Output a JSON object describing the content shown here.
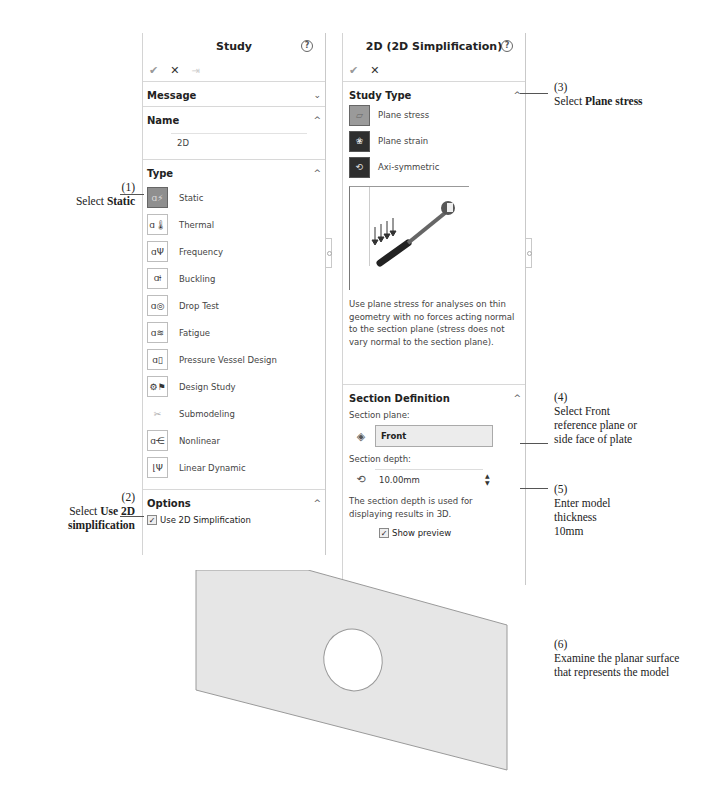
{
  "study_panel": {
    "title": "Study",
    "toolbar": {
      "ok": "✔",
      "cancel": "✕",
      "pin": "⇥"
    },
    "message": {
      "label": "Message",
      "chevron": "⌄"
    },
    "name": {
      "label": "Name",
      "value": "2D",
      "chevron": "^"
    },
    "type": {
      "label": "Type",
      "chevron": "^",
      "items": [
        {
          "label": "Static",
          "icon": "static-icon",
          "glyph": "ɑ⚡",
          "selected": true
        },
        {
          "label": "Thermal",
          "icon": "thermal-icon",
          "glyph": "ɑ🌡"
        },
        {
          "label": "Frequency",
          "icon": "frequency-icon",
          "glyph": "ɑΨ"
        },
        {
          "label": "Buckling",
          "icon": "buckling-icon",
          "glyph": "ɑ⟊"
        },
        {
          "label": "Drop Test",
          "icon": "drop-test-icon",
          "glyph": "ɑ◎"
        },
        {
          "label": "Fatigue",
          "icon": "fatigue-icon",
          "glyph": "ɑ≋"
        },
        {
          "label": "Pressure Vessel Design",
          "icon": "pressure-vessel-icon",
          "glyph": "ɑ▯"
        },
        {
          "label": "Design Study",
          "icon": "design-study-icon",
          "glyph": "⚙⚑"
        },
        {
          "label": "Submodeling",
          "icon": "submodeling-icon",
          "glyph": "✂"
        },
        {
          "label": "Nonlinear",
          "icon": "nonlinear-icon",
          "glyph": "ɑ⋲"
        },
        {
          "label": "Linear Dynamic",
          "icon": "linear-dynamic-icon",
          "glyph": "⌊Ψ"
        }
      ]
    },
    "options": {
      "label": "Options",
      "chevron": "^",
      "use_2d": {
        "label": "Use 2D Simplification",
        "checked": true,
        "mark": "✓"
      }
    }
  },
  "simplification_panel": {
    "title": "2D (2D Simplification)",
    "toolbar": {
      "ok": "✔",
      "cancel": "✕"
    },
    "study_type": {
      "label": "Study Type",
      "chevron": "^",
      "items": [
        {
          "label": "Plane stress",
          "icon": "plane-stress-icon",
          "glyph": "▱",
          "selected": true
        },
        {
          "label": "Plane strain",
          "icon": "plane-strain-icon",
          "glyph": "❀"
        },
        {
          "label": "Axi-symmetric",
          "icon": "axi-symmetric-icon",
          "glyph": "⟲"
        }
      ],
      "description": "Use plane stress for analyses on thin geometry with no forces acting normal to the section plane (stress does not vary normal to the section plane)."
    },
    "section_definition": {
      "label": "Section Definition",
      "chevron": "^",
      "plane_label": "Section plane:",
      "plane_value": "Front",
      "depth_label": "Section depth:",
      "depth_value": "10.00mm",
      "spinner_up": "▲",
      "spinner_down": "▼",
      "depth_note": "The section depth is used for displaying results in 3D.",
      "show_preview": {
        "label": "Show preview",
        "checked": true,
        "mark": "✓"
      }
    }
  },
  "callouts": {
    "c1": {
      "num": "(1)",
      "pre": "Select ",
      "bold": "Static"
    },
    "c2": {
      "num": "(2)",
      "pre": "Select ",
      "bold1": "Use 2D",
      "bold2": "simplification"
    },
    "c3": {
      "num": "(3)",
      "pre": "Select ",
      "bold": "Plane stress"
    },
    "c4": {
      "num": "(4)",
      "line1": "Select Front",
      "line2": "reference plane or",
      "line3": "side face of plate"
    },
    "c5": {
      "num": "(5)",
      "line1": "Enter model",
      "line2": "thickness",
      "line3": "10mm"
    },
    "c6": {
      "num": "(6)",
      "line1": "Examine the planar surface",
      "line2": "that represents the model"
    }
  },
  "colors": {
    "plate_fill": "#e6e6e6",
    "plate_edge": "#9a9a9a",
    "selected_icon": "#8f8f8f",
    "panel_border": "#c9c9c9"
  }
}
